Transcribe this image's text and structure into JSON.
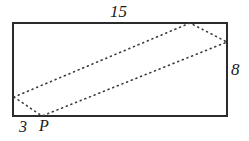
{
  "figure": {
    "background_color": "#ffffff",
    "stroke_color": "#2b2b2b",
    "dash_color": "#3a3a3a",
    "canvas": {
      "width": 249,
      "height": 141
    },
    "rectangle": {
      "name": "outer-rectangle",
      "x": 13,
      "y": 23,
      "width": 214,
      "height": 93,
      "stroke_width": 1.6,
      "fill": "none"
    },
    "parallelogram": {
      "name": "inscribed-parallelogram",
      "style": "dotted",
      "dash_pattern": "1 4",
      "stroke_width": 1.6,
      "points": "14,97 42,116 227,42 190,23",
      "vertices": [
        {
          "name": "left-edge-vertex",
          "x": 14,
          "y": 97,
          "on": "left side"
        },
        {
          "name": "point-p",
          "x": 42,
          "y": 116,
          "on": "bottom side"
        },
        {
          "name": "right-edge-vertex",
          "x": 227,
          "y": 42,
          "on": "right side"
        },
        {
          "name": "top-edge-vertex",
          "x": 190,
          "y": 23,
          "on": "top side"
        }
      ]
    },
    "labels": {
      "top": "15",
      "right": "8",
      "bottom_left": "3",
      "point": "P"
    }
  }
}
